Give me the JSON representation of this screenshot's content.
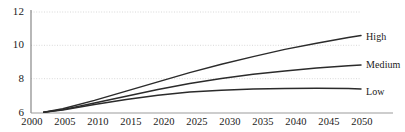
{
  "chart_data": {
    "type": "line",
    "title": "",
    "subtitle": "",
    "xlabel": "",
    "ylabel": "",
    "xlim": [
      2000,
      2052
    ],
    "ylim": [
      6,
      12
    ],
    "grid": true,
    "legend_position": "right-inline",
    "x_ticks": [
      "2000",
      "2005",
      "2010",
      "2015",
      "2020",
      "2025",
      "2030",
      "2035",
      "2040",
      "2045",
      "2050"
    ],
    "y_ticks": [
      "6",
      "8",
      "10",
      "12"
    ],
    "x": [
      2002,
      2005,
      2010,
      2015,
      2020,
      2025,
      2030,
      2035,
      2040,
      2045,
      2050,
      2052
    ],
    "series": [
      {
        "name": "High",
        "label": "High",
        "color": "#2b2b2b",
        "values": [
          6.05,
          6.25,
          6.75,
          7.3,
          7.85,
          8.4,
          8.9,
          9.35,
          9.78,
          10.15,
          10.48,
          10.6
        ]
      },
      {
        "name": "Medium",
        "label": "Medium",
        "color": "#2b2b2b",
        "values": [
          6.05,
          6.2,
          6.6,
          7.0,
          7.4,
          7.75,
          8.05,
          8.3,
          8.5,
          8.68,
          8.8,
          8.85
        ]
      },
      {
        "name": "Low",
        "label": "Low",
        "color": "#2b2b2b",
        "values": [
          6.05,
          6.18,
          6.5,
          6.8,
          7.05,
          7.25,
          7.35,
          7.42,
          7.46,
          7.47,
          7.45,
          7.43
        ]
      }
    ]
  },
  "style": {
    "axis_color": "#8a8a8a",
    "grid_color": "#d8d8d8",
    "line_color": "#2b2b2b",
    "text_color": "#1a1a1a",
    "background": "#ffffff"
  }
}
